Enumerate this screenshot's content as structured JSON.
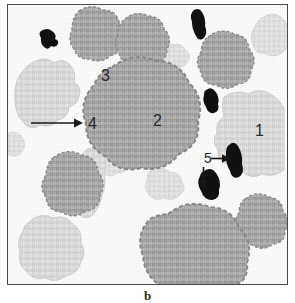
{
  "figure": {
    "panel_label": "b",
    "type": "histology-micrograph",
    "background_color": "#fdfdfd",
    "frame_color": "#4a4a4a"
  },
  "palette": {
    "dark_stain": "#111111",
    "medium_stain": "#a9a9a9",
    "medium_stain_rim": "#8e8e8e",
    "light_stain": "#dedede",
    "light_stain_rim": "#cfcfcf",
    "label_text": "#2a2a2a"
  },
  "annotations": [
    {
      "id": "label-1",
      "text": "1",
      "x": 247,
      "y": 118,
      "target": "light-stained-region-right",
      "arrow": "none"
    },
    {
      "id": "label-2",
      "text": "2",
      "x": 145,
      "y": 108,
      "target": "large-central-cluster",
      "arrow": "none"
    },
    {
      "id": "label-3",
      "text": "3",
      "x": 93,
      "y": 63,
      "target": "unstained-background",
      "arrow": "none"
    },
    {
      "id": "label-4",
      "text": "4",
      "x": 80,
      "y": 111,
      "target": "cluster-rim",
      "arrow": "right"
    },
    {
      "id": "label-5",
      "text": "5",
      "x": 196,
      "y": 146,
      "target": "dark-stained-particles",
      "arrow": "right-and-down"
    }
  ],
  "objects": {
    "dark_particles": 5,
    "medium_clusters": 8,
    "light_patches": 9
  }
}
